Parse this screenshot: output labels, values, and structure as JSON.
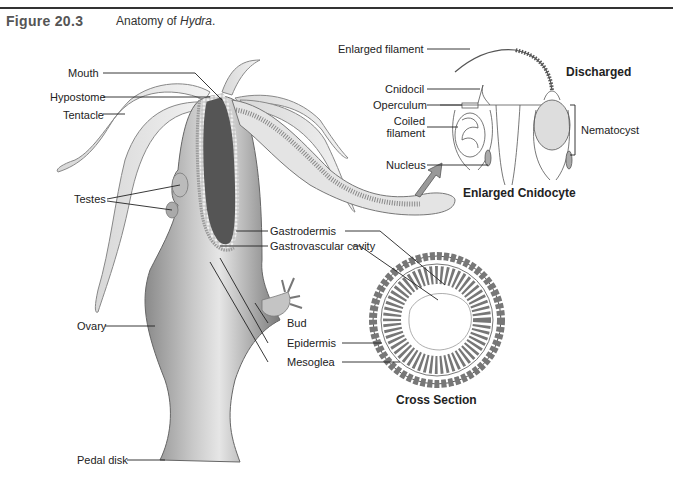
{
  "figure": {
    "number": "Figure 20.3",
    "caption_prefix": "Anatomy of ",
    "caption_italic": "Hydra",
    "caption_suffix": "."
  },
  "labels": {
    "mouth": "Mouth",
    "hypostome": "Hypostome",
    "tentacle": "Tentacle",
    "testes": "Testes",
    "ovary": "Ovary",
    "pedal_disk": "Pedal disk",
    "gastrodermis": "Gastrodermis",
    "gastrovascular_cavity": "Gastrovascular cavity",
    "bud": "Bud",
    "epidermis": "Epidermis",
    "mesoglea": "Mesoglea",
    "enlarged_filament": "Enlarged filament",
    "cnidocil": "Cnidocil",
    "operculum": "Operculum",
    "coiled_filament_1": "Coiled",
    "coiled_filament_2": "filament",
    "nucleus": "Nucleus",
    "nematocyst": "Nematocyst"
  },
  "headings": {
    "discharged": "Discharged",
    "enlarged_cnidocyte": "Enlarged Cnidocyte",
    "cross_section": "Cross Section"
  }
}
